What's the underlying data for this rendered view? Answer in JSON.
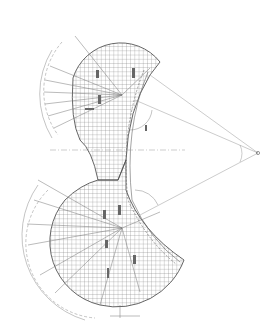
{
  "diagram": {
    "type": "technical-plan-drawing",
    "colors": {
      "background": "#ffffff",
      "line": "#555555",
      "grid": "#777777",
      "light": "#999999"
    },
    "labels": {
      "focal_point": "",
      "upper_angle": "",
      "lower_angle": ""
    }
  }
}
